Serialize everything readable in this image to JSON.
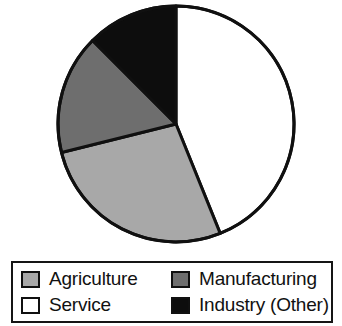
{
  "chart_data": {
    "type": "pie",
    "title": "",
    "subtitle": "",
    "xlabel": "",
    "ylabel": "",
    "grid": false,
    "legend_position": "bottom",
    "legend_layout": "2x2-bordered-box",
    "start_angle_deg": 0,
    "direction": "clockwise",
    "categories": [
      "Service",
      "Agriculture",
      "Manufacturing",
      "Industry (Other)"
    ],
    "values": [
      44,
      27,
      16,
      13
    ],
    "units": "percent",
    "slices": [
      {
        "label": "Service",
        "value": 44,
        "start_angle_deg": 0,
        "end_angle_deg": 158,
        "color": "#ffffff",
        "swatch": "swatch-service",
        "legend_row": 2,
        "legend_col": 1
      },
      {
        "label": "Agriculture",
        "value": 27,
        "start_angle_deg": 158,
        "end_angle_deg": 256,
        "color": "#a8a8a8",
        "swatch": "swatch-agriculture",
        "legend_row": 1,
        "legend_col": 1
      },
      {
        "label": "Manufacturing",
        "value": 16,
        "start_angle_deg": 256,
        "end_angle_deg": 315,
        "color": "#6e6e6e",
        "swatch": "swatch-manufacturing",
        "legend_row": 1,
        "legend_col": 2
      },
      {
        "label": "Industry (Other)",
        "value": 13,
        "start_angle_deg": 315,
        "end_angle_deg": 360,
        "color": "#0d0d0d",
        "swatch": "swatch-industry",
        "legend_row": 2,
        "legend_col": 2
      }
    ],
    "geometry": {
      "center_x": 176,
      "center_y": 124,
      "radius": 118,
      "outline_color": "#101010",
      "outline_width": 3
    }
  },
  "legend": {
    "entries": [
      {
        "label": "Agriculture"
      },
      {
        "label": "Manufacturing"
      },
      {
        "label": "Service"
      },
      {
        "label": "Industry (Other)"
      }
    ],
    "border_color": "#151515",
    "background": "#ffffff"
  },
  "colors": {
    "agriculture": "#a8a8a8",
    "manufacturing": "#6e6e6e",
    "service": "#ffffff",
    "industry_other": "#0d0d0d",
    "outline": "#101010",
    "background": "#ffffff"
  }
}
